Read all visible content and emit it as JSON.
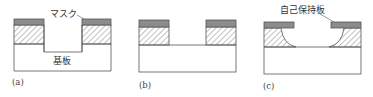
{
  "diagram": {
    "colors": {
      "mask": "#8c8c8c",
      "outline": "#555555",
      "hatch": "#666666",
      "background": "#ffffff"
    },
    "panels": [
      {
        "id": "a",
        "caption": "(a)",
        "labels": {
          "mask": "マスク",
          "substrate": "基板"
        }
      },
      {
        "id": "b",
        "caption": "(b)"
      },
      {
        "id": "c",
        "caption": "(c)",
        "labels": {
          "self_holding_plate": "自己保持板"
        }
      }
    ]
  }
}
